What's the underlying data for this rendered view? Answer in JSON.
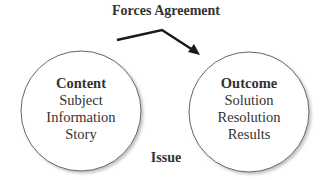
{
  "diagram": {
    "title": "Forces Agreement",
    "bottom_label": "Issue",
    "nodes": [
      {
        "id": "content",
        "heading": "Content",
        "items": [
          "Subject",
          "Information",
          "Story"
        ]
      },
      {
        "id": "outcome",
        "heading": "Outcome",
        "items": [
          "Solution",
          "Resolution",
          "Results"
        ]
      }
    ],
    "edges": [
      {
        "from": "content",
        "to": "outcome",
        "label": "Forces Agreement"
      }
    ],
    "colors": {
      "stroke": "#555555",
      "arrow": "#1a1a1a",
      "text": "#333333"
    }
  }
}
